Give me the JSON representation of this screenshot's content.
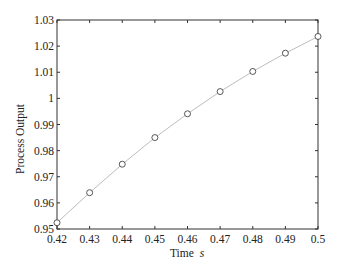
{
  "chart_data": {
    "type": "line",
    "title": "",
    "xlabel": "Time",
    "xlabel_unit_italic": "s",
    "ylabel": "Process Output",
    "xlim": [
      0.42,
      0.5
    ],
    "ylim": [
      0.95,
      1.03
    ],
    "grid": false,
    "legend": null,
    "x_ticks": [
      "0.42",
      "0.43",
      "0.44",
      "0.45",
      "0.46",
      "0.47",
      "0.48",
      "0.49",
      "0.5"
    ],
    "y_ticks": [
      "0.95",
      "0.96",
      "0.97",
      "0.98",
      "0.99",
      "1",
      "1.01",
      "1.02",
      "1.03"
    ],
    "series": [
      {
        "name": "Process Output",
        "line_color": "#bdbdbd",
        "marker": "open-circle",
        "marker_color": "#444444",
        "x": [
          0.42,
          0.43,
          0.44,
          0.45,
          0.46,
          0.47,
          0.48,
          0.49,
          0.5
        ],
        "y": [
          0.9524,
          0.9639,
          0.9748,
          0.985,
          0.9941,
          1.0026,
          1.0103,
          1.0173,
          1.0237
        ]
      }
    ]
  },
  "colors": {
    "axes": "#333333",
    "line": "#bdbdbd",
    "marker": "#444444",
    "background": "#ffffff"
  }
}
